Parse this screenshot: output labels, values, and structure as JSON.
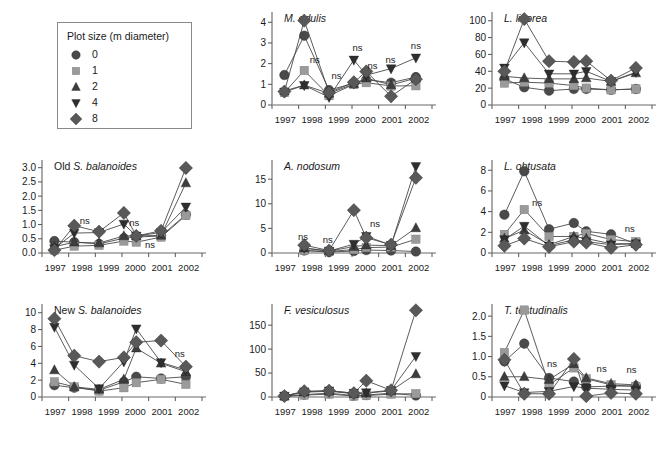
{
  "legend": {
    "title": "Plot size (m diameter)",
    "entries": [
      {
        "label": "0",
        "marker": "circle",
        "color": "#4a4a4a"
      },
      {
        "label": "1",
        "marker": "square",
        "color": "#9a9a9a"
      },
      {
        "label": "2",
        "marker": "triangle-up",
        "color": "#3d3d3d"
      },
      {
        "label": "4",
        "marker": "triangle-down",
        "color": "#2e2e2e"
      },
      {
        "label": "8",
        "marker": "diamond",
        "color": "#595959"
      }
    ]
  },
  "xaxis": {
    "tick_labels": [
      "1997",
      "1998",
      "1999",
      "2000",
      "2001",
      "2002"
    ],
    "n_ticks": 7
  },
  "chart_data": [
    {
      "type": "line",
      "id": "m-edulis",
      "title": "M. edulis",
      "title_prefix": "",
      "xlabel": "",
      "ylabel": "",
      "ylim": [
        0,
        4.4
      ],
      "yticks": [
        0,
        1,
        2,
        3,
        4
      ],
      "ytick_labels": [
        "0",
        "1",
        "2",
        "3",
        "4"
      ],
      "x": [
        0.5,
        1.3,
        2.3,
        3.3,
        3.8,
        4.8,
        5.8
      ],
      "series": [
        {
          "name": "0",
          "marker": "circle",
          "color": "#4a4a4a",
          "values": [
            1.45,
            3.35,
            0.72,
            1.05,
            1.22,
            1.08,
            1.35
          ]
        },
        {
          "name": "1",
          "marker": "square",
          "color": "#9a9a9a",
          "values": [
            0.6,
            1.67,
            0.45,
            1.0,
            1.08,
            0.92,
            0.93
          ]
        },
        {
          "name": "2",
          "marker": "triangle-up",
          "color": "#3d3d3d",
          "values": [
            0.68,
            0.96,
            0.56,
            1.02,
            1.3,
            0.97,
            1.3
          ]
        },
        {
          "name": "4",
          "marker": "triangle-down",
          "color": "#2e2e2e",
          "values": [
            0.63,
            0.95,
            0.38,
            2.18,
            1.44,
            1.76,
            2.28
          ]
        },
        {
          "name": "8",
          "marker": "diamond",
          "color": "#595959",
          "values": [
            0.65,
            4.08,
            0.6,
            1.1,
            1.62,
            0.42,
            1.25
          ]
        }
      ],
      "ns_labels": [
        {
          "x": 1.72,
          "y": 2.05
        },
        {
          "x": 2.6,
          "y": 1.28
        },
        {
          "x": 3.45,
          "y": 2.62
        },
        {
          "x": 4.05,
          "y": 1.72
        },
        {
          "x": 4.78,
          "y": 2.05
        },
        {
          "x": 5.8,
          "y": 2.7
        }
      ]
    },
    {
      "type": "line",
      "id": "l-littorea",
      "title": "L. littorea",
      "title_prefix": "",
      "xlabel": "",
      "ylabel": "",
      "ylim": [
        0,
        108
      ],
      "yticks": [
        0,
        20,
        40,
        60,
        80,
        100
      ],
      "ytick_labels": [
        "0",
        "20",
        "40",
        "60",
        "80",
        "100"
      ],
      "x": [
        0.5,
        1.3,
        2.3,
        3.3,
        3.8,
        4.8,
        5.8
      ],
      "series": [
        {
          "name": "0",
          "marker": "circle",
          "color": "#4a4a4a",
          "values": [
            31,
            21,
            17,
            19,
            19,
            18,
            19
          ]
        },
        {
          "name": "1",
          "marker": "square",
          "color": "#9a9a9a",
          "values": [
            26,
            27,
            26,
            23,
            20,
            18,
            19
          ]
        },
        {
          "name": "2",
          "marker": "triangle-up",
          "color": "#3d3d3d",
          "values": [
            34,
            32,
            31,
            31,
            32,
            28,
            38
          ]
        },
        {
          "name": "4",
          "marker": "triangle-down",
          "color": "#2e2e2e",
          "values": [
            44,
            74,
            37,
            37,
            40,
            28,
            39
          ]
        },
        {
          "name": "8",
          "marker": "diamond",
          "color": "#595959",
          "values": [
            40,
            102,
            52,
            51,
            52,
            29,
            44
          ]
        }
      ],
      "ns_labels": []
    },
    {
      "type": "line",
      "id": "old-s-balanoides",
      "title": "S. balanoides",
      "title_prefix": "Old ",
      "xlabel": "",
      "ylabel": "",
      "ylim": [
        0,
        3.2
      ],
      "yticks": [
        0,
        0.5,
        1.0,
        1.5,
        2.0,
        2.5,
        3.0
      ],
      "ytick_labels": [
        "0.0",
        "0.5",
        "1.0",
        "1.5",
        "2.0",
        "2.5",
        "3.0"
      ],
      "x": [
        0.5,
        1.3,
        2.3,
        3.3,
        3.8,
        4.8,
        5.8
      ],
      "series": [
        {
          "name": "0",
          "marker": "circle",
          "color": "#4a4a4a",
          "values": [
            0.42,
            0.38,
            0.32,
            0.52,
            0.56,
            0.6,
            1.35
          ]
        },
        {
          "name": "1",
          "marker": "square",
          "color": "#9a9a9a",
          "values": [
            0.1,
            0.24,
            0.27,
            0.42,
            0.38,
            0.56,
            1.32
          ]
        },
        {
          "name": "2",
          "marker": "triangle-up",
          "color": "#3d3d3d",
          "values": [
            0.22,
            0.38,
            0.35,
            0.6,
            0.6,
            0.62,
            2.46
          ]
        },
        {
          "name": "4",
          "marker": "triangle-down",
          "color": "#2e2e2e",
          "values": [
            0.16,
            0.7,
            0.72,
            1.02,
            0.6,
            0.72,
            1.62
          ]
        },
        {
          "name": "8",
          "marker": "diamond",
          "color": "#595959",
          "values": [
            0.1,
            0.96,
            0.75,
            1.41,
            0.6,
            0.78,
            2.99
          ]
        }
      ],
      "ns_labels": [
        {
          "x": 1.72,
          "y": 1.02
        },
        {
          "x": 3.72,
          "y": 0.96
        },
        {
          "x": 4.35,
          "y": 0.18
        }
      ]
    },
    {
      "type": "line",
      "id": "a-nodosum",
      "title": "A. nodosum",
      "title_prefix": "",
      "xlabel": "",
      "ylabel": "",
      "ylim": [
        0,
        18.5
      ],
      "yticks": [
        0,
        5,
        10,
        15
      ],
      "ytick_labels": [
        "0",
        "5",
        "10",
        "15"
      ],
      "x": [
        1.3,
        2.3,
        3.3,
        3.8,
        4.8,
        5.8
      ],
      "series": [
        {
          "name": "0",
          "marker": "circle",
          "color": "#4a4a4a",
          "values": [
            0.5,
            0.2,
            0.4,
            0.6,
            0.5,
            0.3
          ]
        },
        {
          "name": "1",
          "marker": "square",
          "color": "#9a9a9a",
          "values": [
            0.5,
            0.3,
            0.7,
            1.1,
            1.2,
            2.8
          ]
        },
        {
          "name": "2",
          "marker": "triangle-up",
          "color": "#3d3d3d",
          "values": [
            1.0,
            0.4,
            1.3,
            1.6,
            1.5,
            5.1
          ]
        },
        {
          "name": "4",
          "marker": "triangle-down",
          "color": "#2e2e2e",
          "values": [
            1.0,
            0.4,
            1.8,
            3.4,
            1.6,
            17.6
          ]
        },
        {
          "name": "8",
          "marker": "diamond",
          "color": "#595959",
          "values": [
            1.6,
            0.5,
            8.7,
            3.1,
            1.7,
            15.3
          ]
        }
      ],
      "ns_labels": [
        {
          "x": 1.25,
          "y": 2.6
        },
        {
          "x": 2.25,
          "y": 2.1
        },
        {
          "x": 4.15,
          "y": 5.2
        }
      ]
    },
    {
      "type": "line",
      "id": "l-obtusata",
      "title": "L. obtusata",
      "title_prefix": "",
      "xlabel": "",
      "ylabel": "",
      "ylim": [
        0,
        8.8
      ],
      "yticks": [
        0,
        2,
        4,
        6,
        8
      ],
      "ytick_labels": [
        "0",
        "2",
        "4",
        "6",
        "8"
      ],
      "x": [
        0.5,
        1.3,
        2.3,
        3.3,
        3.8,
        4.8,
        5.8
      ],
      "series": [
        {
          "name": "0",
          "marker": "circle",
          "color": "#4a4a4a",
          "values": [
            3.7,
            7.9,
            2.3,
            2.9,
            2.1,
            1.8,
            0.9
          ]
        },
        {
          "name": "1",
          "marker": "square",
          "color": "#9a9a9a",
          "values": [
            1.8,
            4.2,
            1.6,
            1.6,
            1.9,
            1.3,
            1.1
          ]
        },
        {
          "name": "2",
          "marker": "triangle-up",
          "color": "#3d3d3d",
          "values": [
            1.4,
            2.2,
            0.8,
            1.6,
            1.4,
            0.9,
            0.9
          ]
        },
        {
          "name": "4",
          "marker": "triangle-down",
          "color": "#2e2e2e",
          "values": [
            1.3,
            2.6,
            0.7,
            1.3,
            1.1,
            0.8,
            0.9
          ]
        },
        {
          "name": "8",
          "marker": "diamond",
          "color": "#595959",
          "values": [
            0.7,
            1.4,
            0.6,
            1.1,
            1.0,
            0.5,
            0.8
          ]
        }
      ],
      "ns_labels": [
        {
          "x": 1.82,
          "y": 4.5
        },
        {
          "x": 5.55,
          "y": 2.0
        }
      ]
    },
    {
      "type": "line",
      "id": "new-s-balanoides",
      "title": "S. balanoides",
      "title_prefix": "New ",
      "xlabel": "",
      "ylabel": "",
      "ylim": [
        0,
        10.8
      ],
      "yticks": [
        0,
        2,
        4,
        6,
        8,
        10
      ],
      "ytick_labels": [
        "0",
        "2",
        "4",
        "6",
        "8",
        "10"
      ],
      "x": [
        0.5,
        1.3,
        2.3,
        3.3,
        3.8,
        4.8,
        5.8
      ],
      "series": [
        {
          "name": "0",
          "marker": "circle",
          "color": "#4a4a4a",
          "values": [
            1.4,
            1.1,
            0.8,
            1.8,
            2.4,
            2.2,
            2.4
          ]
        },
        {
          "name": "1",
          "marker": "square",
          "color": "#9a9a9a",
          "values": [
            1.8,
            1.2,
            0.7,
            1.1,
            1.7,
            2.1,
            1.5
          ]
        },
        {
          "name": "2",
          "marker": "triangle-up",
          "color": "#3d3d3d",
          "values": [
            3.2,
            1.2,
            0.9,
            2.1,
            5.8,
            4.0,
            3.0
          ]
        },
        {
          "name": "4",
          "marker": "triangle-down",
          "color": "#2e2e2e",
          "values": [
            8.3,
            3.8,
            1.0,
            4.2,
            8.1,
            4.1,
            3.2
          ]
        },
        {
          "name": "8",
          "marker": "diamond",
          "color": "#595959",
          "values": [
            9.3,
            4.9,
            4.2,
            4.7,
            6.5,
            6.7,
            3.6
          ]
        }
      ],
      "ns_labels": [
        {
          "x": 5.55,
          "y": 4.7
        }
      ]
    },
    {
      "type": "line",
      "id": "f-vesiculosus",
      "title": "F. vesiculosus",
      "title_prefix": "",
      "xlabel": "",
      "ylabel": "",
      "ylim": [
        0,
        190
      ],
      "yticks": [
        0,
        50,
        100,
        150
      ],
      "ytick_labels": [
        "0",
        "50",
        "100",
        "150"
      ],
      "x": [
        0.5,
        1.3,
        2.3,
        3.3,
        3.8,
        4.8,
        5.8
      ],
      "series": [
        {
          "name": "0",
          "marker": "circle",
          "color": "#4a4a4a",
          "values": [
            2,
            5,
            8,
            3,
            4,
            8,
            3
          ]
        },
        {
          "name": "1",
          "marker": "square",
          "color": "#9a9a9a",
          "values": [
            1,
            4,
            6,
            2,
            3,
            6,
            7
          ]
        },
        {
          "name": "2",
          "marker": "triangle-up",
          "color": "#3d3d3d",
          "values": [
            2,
            10,
            12,
            7,
            8,
            13,
            48
          ]
        },
        {
          "name": "4",
          "marker": "triangle-down",
          "color": "#2e2e2e",
          "values": [
            2,
            11,
            13,
            8,
            9,
            14,
            85
          ]
        },
        {
          "name": "8",
          "marker": "diamond",
          "color": "#595959",
          "values": [
            2,
            12,
            13,
            8,
            34,
            14,
            181
          ]
        }
      ],
      "ns_labels": []
    },
    {
      "type": "line",
      "id": "t-testudinalis",
      "title": "T. testudinalis",
      "title_prefix": "",
      "xlabel": "",
      "ylabel": "",
      "ylim": [
        0,
        2.25
      ],
      "yticks": [
        0,
        0.5,
        1.0,
        1.5,
        2.0
      ],
      "ytick_labels": [
        "0",
        "0.5",
        "1.0",
        "1.5",
        "2.0"
      ],
      "x": [
        0.5,
        1.3,
        2.3,
        3.3,
        3.8,
        4.8,
        5.8
      ],
      "series": [
        {
          "name": "0",
          "marker": "circle",
          "color": "#4a4a4a",
          "values": [
            0.88,
            1.32,
            0.47,
            0.38,
            0.25,
            0.27,
            0.27
          ]
        },
        {
          "name": "1",
          "marker": "square",
          "color": "#9a9a9a",
          "values": [
            1.1,
            2.15,
            0.3,
            0.72,
            0.45,
            0.3,
            0.26
          ]
        },
        {
          "name": "2",
          "marker": "triangle-up",
          "color": "#3d3d3d",
          "values": [
            0.5,
            0.5,
            0.43,
            0.82,
            0.47,
            0.33,
            0.3
          ]
        },
        {
          "name": "4",
          "marker": "triangle-down",
          "color": "#2e2e2e",
          "values": [
            0.28,
            0.11,
            0.14,
            0.26,
            0.22,
            0.19,
            0.17
          ]
        },
        {
          "name": "8",
          "marker": "diamond",
          "color": "#595959",
          "values": [
            0.92,
            0.08,
            0.08,
            0.94,
            0.02,
            0.1,
            0.08
          ]
        }
      ],
      "ns_labels": [
        {
          "x": 2.42,
          "y": 0.74
        },
        {
          "x": 4.42,
          "y": 0.62
        },
        {
          "x": 5.62,
          "y": 0.6
        }
      ]
    }
  ]
}
